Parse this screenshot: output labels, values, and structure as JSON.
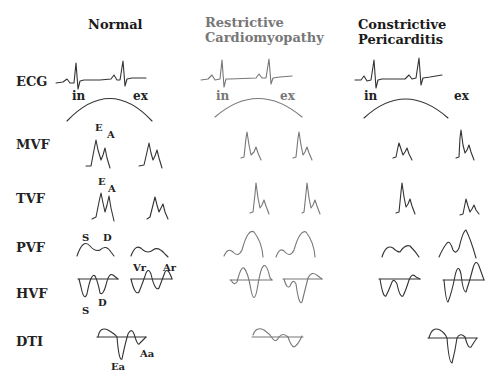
{
  "columns": [
    {
      "title_line1": "Normal",
      "title_line2": "",
      "color": "#1a1a1a"
    },
    {
      "title_line1": "Restrictive",
      "title_line2": "Cardiomyopathy",
      "color": "#777777"
    },
    {
      "title_line1": "Constrictive",
      "title_line2": "Pericarditis",
      "color": "#1a1a1a"
    }
  ],
  "rows": [
    {
      "label": "ECG"
    },
    {
      "label": "MVF"
    },
    {
      "label": "TVF"
    },
    {
      "label": "PVF"
    },
    {
      "label": "HVF"
    },
    {
      "label": "DTI"
    }
  ],
  "respiration": {
    "in": "in",
    "ex": "ex"
  },
  "wave_labels": {
    "E": "E",
    "A": "A",
    "S": "S",
    "D": "D",
    "Vr": "Vr",
    "Ar": "Ar",
    "Ea": "Ea",
    "Aa": "Aa"
  },
  "colors": {
    "normal_stroke": "#333333",
    "restrictive_stroke": "#777777",
    "constrictive_stroke": "#333333"
  }
}
